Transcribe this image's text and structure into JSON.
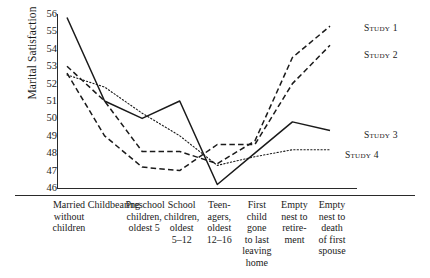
{
  "chart_data": {
    "type": "line",
    "title": "",
    "xlabel": "",
    "ylabel": "Marital Satisfaction",
    "ylim": [
      46,
      56
    ],
    "yticks": [
      56,
      55,
      54,
      53,
      52,
      51,
      50,
      49,
      48,
      47,
      46
    ],
    "grid": false,
    "legend_position": "right-inline-at-line-end",
    "categories": [
      [
        "Married",
        "without",
        "children"
      ],
      [
        "Childbearing"
      ],
      [
        "Preschool",
        "children,",
        "oldest 5"
      ],
      [
        "School",
        "children,",
        "oldest",
        "5–12"
      ],
      [
        "Teen-",
        "agers,",
        "oldest",
        "12–16"
      ],
      [
        "First",
        "child",
        "gone",
        "to last",
        "leaving",
        "home"
      ],
      [
        "Empty",
        "nest to",
        "retire-",
        "ment"
      ],
      [
        "Empty",
        "nest to",
        "death",
        "of first",
        "spouse"
      ]
    ],
    "series": [
      {
        "name": "Study 1",
        "style": "dashed-long",
        "values": [
          53.0,
          51.0,
          48.1,
          48.1,
          47.4,
          48.7,
          53.5,
          55.3
        ]
      },
      {
        "name": "Study 2",
        "style": "dashed-long",
        "values": [
          52.6,
          49.0,
          47.2,
          47.0,
          48.5,
          48.5,
          52.0,
          54.2
        ]
      },
      {
        "name": "Study 3",
        "style": "solid",
        "values": [
          55.8,
          51.0,
          50.0,
          51.0,
          46.2,
          48.0,
          49.8,
          49.3
        ]
      },
      {
        "name": "Study 4",
        "style": "dotted",
        "values": [
          52.5,
          51.8,
          50.3,
          49.0,
          47.3,
          47.8,
          48.2,
          48.2
        ]
      }
    ]
  },
  "legend": {
    "items": [
      {
        "label": "Study 1"
      },
      {
        "label": "Study 2"
      },
      {
        "label": "Study 3"
      },
      {
        "label": "Study 4"
      }
    ]
  }
}
